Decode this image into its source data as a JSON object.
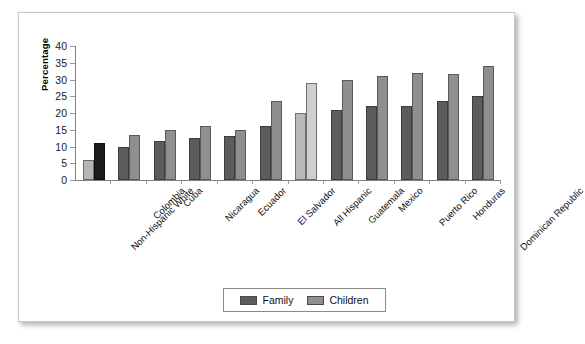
{
  "chart_data": {
    "type": "bar",
    "title": "",
    "xlabel": "",
    "ylabel": "Percentage",
    "ylim": [
      0,
      40
    ],
    "yticks": [
      0,
      5,
      10,
      15,
      20,
      25,
      30,
      35,
      40
    ],
    "grid": false,
    "legend_position": "bottom-center",
    "categories": [
      "Non-Hispanic White",
      "Colombia",
      "Cuba",
      "Nicaragua",
      "Ecuador",
      "El Salvador",
      "All Hispanic",
      "Guatemala",
      "Mexico",
      "Puerto Rico",
      "Honduras",
      "Dominican Republic"
    ],
    "series": [
      {
        "name": "Family",
        "color": "#5c5c5c",
        "values": [
          6,
          10,
          11.5,
          12.5,
          13,
          16,
          20,
          21,
          22,
          22,
          23.5,
          25
        ]
      },
      {
        "name": "Children",
        "color": "#8f8f8f",
        "values": [
          11,
          13.5,
          15,
          16,
          15,
          23.5,
          29,
          30,
          31,
          32,
          31.5,
          34
        ]
      }
    ],
    "highlighted_categories": [
      "All Hispanic"
    ],
    "reference_category": "Non-Hispanic White"
  },
  "legend": {
    "items": [
      {
        "label": "Family",
        "swatch": "family-swatch"
      },
      {
        "label": "Children",
        "swatch": "children-swatch"
      }
    ]
  },
  "axis": {
    "y_title": "Percentage"
  }
}
